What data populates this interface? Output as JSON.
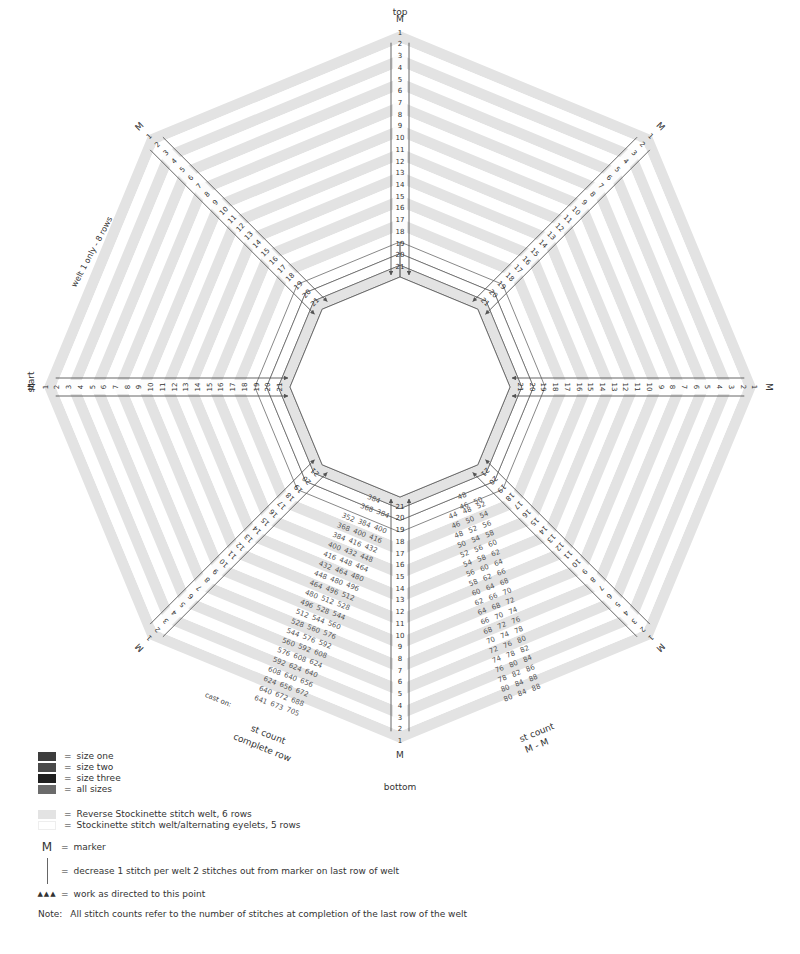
{
  "diagram": {
    "labels": {
      "top": "top",
      "bottom": "bottom",
      "start": "start",
      "marker": "M",
      "welt_note": "welt 1 only - 8 rows",
      "cast_on": "cast on:",
      "st_count_complete_1": "st count",
      "st_count_complete_2": "complete row",
      "st_count_mm_1": "st count",
      "st_count_mm_2": "M - M"
    },
    "row_numbers": [
      "1",
      "2",
      "3",
      "4",
      "5",
      "6",
      "7",
      "8",
      "9",
      "10",
      "11",
      "12",
      "13",
      "14",
      "15",
      "16",
      "17",
      "18",
      "19",
      "20",
      "21"
    ],
    "colors": {
      "rev_stockinette": "#e3e3e3",
      "stockinette": "#ffffff",
      "line": "#555555",
      "text": "#333333"
    },
    "complete_row_counts": [
      [
        "368",
        "384"
      ],
      [
        "352",
        "384",
        "400"
      ],
      [
        "368",
        "400",
        "416"
      ],
      [
        "384",
        "416",
        "432"
      ],
      [
        "400",
        "432",
        "448"
      ],
      [
        "416",
        "448",
        "464"
      ],
      [
        "432",
        "464",
        "480"
      ],
      [
        "448",
        "480",
        "496"
      ],
      [
        "464",
        "496",
        "512"
      ],
      [
        "480",
        "512",
        "528"
      ],
      [
        "496",
        "528",
        "544"
      ],
      [
        "512",
        "544",
        "560"
      ],
      [
        "528",
        "560",
        "576"
      ],
      [
        "544",
        "576",
        "592"
      ],
      [
        "560",
        "592",
        "608"
      ],
      [
        "576",
        "608",
        "624"
      ],
      [
        "592",
        "624",
        "640"
      ],
      [
        "608",
        "640",
        "656"
      ],
      [
        "624",
        "656",
        "672"
      ],
      [
        "640",
        "672",
        "688"
      ],
      [
        "641",
        "673",
        "705"
      ]
    ],
    "complete_row_top_single": "384",
    "mm_counts": [
      [
        "46",
        "50"
      ],
      [
        "44",
        "48",
        "52"
      ],
      [
        "46",
        "50",
        "54"
      ],
      [
        "48",
        "52",
        "56"
      ],
      [
        "50",
        "54",
        "58"
      ],
      [
        "52",
        "56",
        "60"
      ],
      [
        "54",
        "58",
        "62"
      ],
      [
        "56",
        "60",
        "64"
      ],
      [
        "58",
        "62",
        "66"
      ],
      [
        "60",
        "64",
        "68"
      ],
      [
        "62",
        "66",
        "70"
      ],
      [
        "64",
        "68",
        "72"
      ],
      [
        "66",
        "70",
        "74"
      ],
      [
        "68",
        "72",
        "76"
      ],
      [
        "70",
        "74",
        "78"
      ],
      [
        "72",
        "76",
        "80"
      ],
      [
        "74",
        "78",
        "82"
      ],
      [
        "76",
        "80",
        "84"
      ],
      [
        "78",
        "82",
        "86"
      ],
      [
        "80",
        "84",
        "88"
      ],
      [
        "80",
        "84",
        "88"
      ]
    ],
    "mm_top_single": "48"
  },
  "legend": {
    "sizes": [
      {
        "label": "size one",
        "color": "#3d3d3d"
      },
      {
        "label": "size two",
        "color": "#4a4a4a"
      },
      {
        "label": "size three",
        "color": "#1f1f1f"
      },
      {
        "label": "all sizes",
        "color": "#6b6b6b"
      }
    ],
    "welts": [
      {
        "label": "Reverse Stockinette stitch welt, 6 rows",
        "color": "#e3e3e3"
      },
      {
        "label": "Stockinette stitch welt/alternating eyelets, 5 rows",
        "color": "#ffffff"
      }
    ],
    "eq": "=",
    "marker_symbol": "M",
    "marker_label": "marker",
    "decrease_label": "decrease 1 stitch per welt 2 stitches out from marker on last row of welt",
    "work_symbol": "▲▲▲",
    "work_label": "work as directed to this point",
    "note_prefix": "Note:",
    "note_text": "All stitch counts refer to the number of stitches at completion of the last row of the welt"
  }
}
